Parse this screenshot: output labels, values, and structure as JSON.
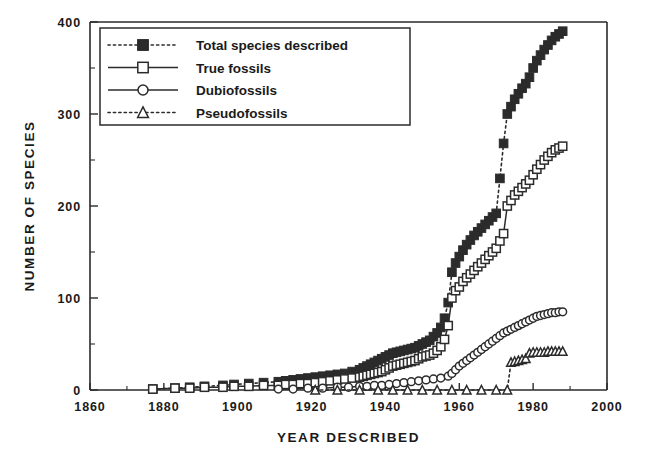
{
  "chart_data": {
    "type": "line",
    "title": "",
    "xlabel": "YEAR  DESCRIBED",
    "ylabel": "NUMBER  OF  SPECIES",
    "xlim": [
      1860,
      2000
    ],
    "ylim": [
      0,
      400
    ],
    "xticks": [
      1860,
      1880,
      1900,
      1920,
      1940,
      1960,
      1980,
      2000
    ],
    "xtick_labels": [
      "1860",
      "1880",
      "1900",
      "1920",
      "1940",
      "1960",
      "1980",
      "2000"
    ],
    "xminor_step": 10,
    "yticks": [
      0,
      100,
      200,
      300,
      400
    ],
    "ytick_labels": [
      "0",
      "100",
      "200",
      "300",
      "400"
    ],
    "yminor_step": 50,
    "grid": false,
    "legend_position": "upper-left",
    "legend_entries": [
      "Total species described",
      "True fossils",
      "Dubiofossils",
      "Pseudofossils"
    ],
    "series": [
      {
        "name": "Total species described",
        "marker": "filled-square",
        "linestyle": "dotted",
        "color": "#2b2b2b",
        "x": [
          1877,
          1883,
          1887,
          1891,
          1896,
          1899,
          1903,
          1907,
          1911,
          1913,
          1915,
          1917,
          1919,
          1921,
          1923,
          1925,
          1927,
          1929,
          1931,
          1933,
          1934,
          1935,
          1936,
          1937,
          1938,
          1939,
          1940,
          1941,
          1942,
          1943,
          1944,
          1945,
          1946,
          1947,
          1948,
          1949,
          1950,
          1951,
          1952,
          1953,
          1954,
          1955,
          1956,
          1957,
          1958,
          1959,
          1960,
          1961,
          1962,
          1963,
          1964,
          1965,
          1966,
          1967,
          1968,
          1969,
          1970,
          1971,
          1972,
          1973,
          1974,
          1975,
          1976,
          1977,
          1978,
          1979,
          1980,
          1981,
          1982,
          1983,
          1984,
          1985,
          1986,
          1987,
          1988
        ],
        "y": [
          1,
          2,
          3,
          4,
          5,
          6,
          7,
          8,
          9,
          10,
          11,
          12,
          13,
          14,
          15,
          16,
          17,
          18,
          20,
          22,
          24,
          26,
          28,
          30,
          32,
          34,
          36,
          38,
          40,
          41,
          42,
          43,
          44,
          45,
          46,
          48,
          50,
          52,
          54,
          58,
          62,
          68,
          78,
          95,
          128,
          138,
          145,
          152,
          158,
          163,
          168,
          172,
          176,
          180,
          184,
          188,
          192,
          230,
          268,
          300,
          308,
          316,
          322,
          328,
          333,
          340,
          350,
          358,
          364,
          370,
          375,
          380,
          384,
          387,
          390
        ]
      },
      {
        "name": "True fossils",
        "marker": "open-square",
        "linestyle": "solid",
        "color": "#2b2b2b",
        "x": [
          1877,
          1883,
          1887,
          1891,
          1896,
          1899,
          1903,
          1907,
          1911,
          1913,
          1915,
          1917,
          1919,
          1921,
          1923,
          1925,
          1927,
          1929,
          1931,
          1933,
          1934,
          1935,
          1936,
          1937,
          1938,
          1939,
          1940,
          1941,
          1942,
          1943,
          1944,
          1945,
          1946,
          1947,
          1948,
          1949,
          1950,
          1951,
          1952,
          1953,
          1954,
          1955,
          1956,
          1957,
          1958,
          1959,
          1960,
          1961,
          1962,
          1963,
          1964,
          1965,
          1966,
          1967,
          1968,
          1969,
          1970,
          1971,
          1972,
          1973,
          1974,
          1975,
          1976,
          1977,
          1978,
          1979,
          1980,
          1981,
          1982,
          1983,
          1984,
          1985,
          1986,
          1987,
          1988
        ],
        "y": [
          1,
          2,
          2,
          3,
          3,
          4,
          4,
          5,
          5,
          6,
          6,
          7,
          7,
          8,
          9,
          10,
          11,
          12,
          13,
          14,
          15,
          16,
          17,
          18,
          19,
          20,
          22,
          24,
          26,
          27,
          28,
          29,
          30,
          31,
          32,
          34,
          36,
          37,
          38,
          40,
          43,
          47,
          55,
          70,
          100,
          108,
          112,
          118,
          122,
          126,
          130,
          134,
          138,
          142,
          146,
          150,
          154,
          162,
          170,
          200,
          206,
          212,
          216,
          220,
          224,
          228,
          234,
          240,
          245,
          250,
          254,
          258,
          261,
          263,
          265
        ]
      },
      {
        "name": "Dubiofossils",
        "marker": "open-circle",
        "linestyle": "solid",
        "color": "#2b2b2b",
        "x": [
          1911,
          1915,
          1919,
          1923,
          1927,
          1930,
          1933,
          1935,
          1937,
          1939,
          1941,
          1943,
          1945,
          1947,
          1949,
          1951,
          1953,
          1955,
          1957,
          1958,
          1959,
          1960,
          1961,
          1962,
          1963,
          1964,
          1965,
          1966,
          1967,
          1968,
          1969,
          1970,
          1971,
          1972,
          1973,
          1974,
          1975,
          1976,
          1977,
          1978,
          1979,
          1980,
          1981,
          1982,
          1983,
          1984,
          1985,
          1986,
          1987,
          1988
        ],
        "y": [
          1,
          1,
          2,
          2,
          3,
          3,
          4,
          4,
          5,
          5,
          6,
          7,
          8,
          9,
          10,
          11,
          12,
          13,
          15,
          18,
          22,
          26,
          29,
          32,
          35,
          38,
          41,
          44,
          47,
          50,
          53,
          56,
          59,
          62,
          64,
          66,
          68,
          70,
          72,
          74,
          76,
          78,
          80,
          81,
          82,
          83,
          84,
          84,
          85,
          85
        ]
      },
      {
        "name": "Pseudofossils",
        "marker": "open-triangle",
        "linestyle": "dotted",
        "color": "#2b2b2b",
        "x": [
          1921,
          1927,
          1933,
          1938,
          1942,
          1946,
          1950,
          1954,
          1958,
          1962,
          1966,
          1970,
          1973,
          1974,
          1975,
          1976,
          1977,
          1978,
          1979,
          1980,
          1981,
          1982,
          1983,
          1984,
          1985,
          1986,
          1987,
          1988
        ],
        "y": [
          0,
          0,
          0,
          0,
          0,
          0,
          0,
          0,
          0,
          0,
          0,
          0,
          0,
          30,
          31,
          32,
          33,
          34,
          40,
          41,
          41,
          41,
          41,
          42,
          42,
          42,
          42,
          42
        ]
      }
    ]
  },
  "icons": {
    "legend_swatch_total": "filled-square-dotted-line-icon",
    "legend_swatch_true": "open-square-solid-line-icon",
    "legend_swatch_dubio": "open-circle-solid-line-icon",
    "legend_swatch_pseudo": "open-triangle-dotted-line-icon"
  }
}
